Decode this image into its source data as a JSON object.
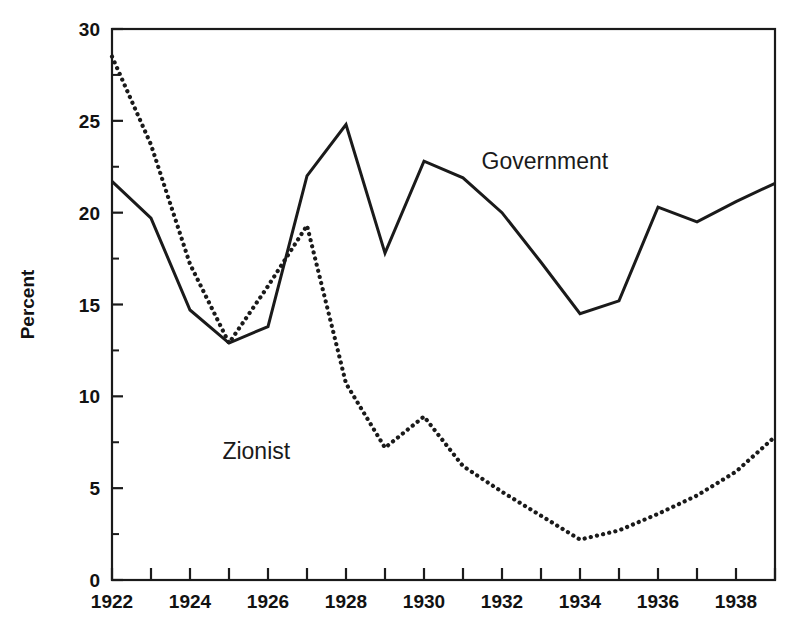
{
  "chart_data": {
    "type": "line",
    "title": "",
    "xlabel": "",
    "ylabel": "Percent",
    "xlim": [
      1921.5,
      1939.5
    ],
    "ylim": [
      0,
      30
    ],
    "grid": false,
    "legend_position": "inline-annotation",
    "x_tick_labels": [
      "1922",
      "1924",
      "1926",
      "1928",
      "1930",
      "1932",
      "1934",
      "1936",
      "1938"
    ],
    "x_major_ticks": [
      1922,
      1924,
      1926,
      1928,
      1930,
      1932,
      1934,
      1936,
      1938
    ],
    "x_minor_ticks": [
      1923,
      1925,
      1927,
      1929,
      1931,
      1933,
      1935,
      1937,
      1939
    ],
    "y_tick_labels": [
      "0",
      "5",
      "10",
      "15",
      "20",
      "25",
      "30"
    ],
    "y_major_ticks": [
      0,
      5,
      10,
      15,
      20,
      25,
      30
    ],
    "y_minor_ticks": [
      2.5,
      7.5,
      12.5,
      17.5,
      22.5,
      27.5
    ],
    "x": [
      1922,
      1923,
      1924,
      1925,
      1926,
      1927,
      1928,
      1929,
      1930,
      1931,
      1932,
      1933,
      1934,
      1935,
      1936,
      1937,
      1938,
      1939
    ],
    "series": [
      {
        "name": "Government",
        "style": "solid",
        "color": "#1a1a1a",
        "label_text": "Government",
        "label_x": 1933.1,
        "label_y": 22.4,
        "values": [
          21.7,
          19.7,
          14.7,
          12.9,
          13.8,
          22.0,
          24.8,
          17.8,
          22.8,
          21.9,
          20.0,
          17.3,
          14.5,
          15.2,
          20.3,
          19.5,
          20.6,
          21.6
        ]
      },
      {
        "name": "Zionist",
        "style": "dotted",
        "color": "#1a1a1a",
        "label_text": "Zionist",
        "label_x": 1925.7,
        "label_y": 6.6,
        "values": [
          28.5,
          23.7,
          17.2,
          12.9,
          16.0,
          19.3,
          10.7,
          7.2,
          8.9,
          6.2,
          4.8,
          3.5,
          2.2,
          2.7,
          3.6,
          4.6,
          5.9,
          7.8
        ]
      }
    ]
  },
  "axis": {
    "y_axis_title": "Percent"
  }
}
